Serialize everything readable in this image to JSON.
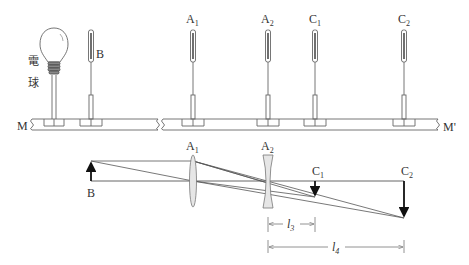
{
  "apparatus": {
    "bulb_label": [
      "電",
      "球"
    ],
    "holders": [
      {
        "id": "B",
        "label": "B",
        "sub": "",
        "x": 91
      },
      {
        "id": "A1",
        "label": "A",
        "sub": "1",
        "x": 193
      },
      {
        "id": "A2",
        "label": "A",
        "sub": "2",
        "x": 268
      },
      {
        "id": "C1",
        "label": "C",
        "sub": "1",
        "x": 315
      },
      {
        "id": "C2",
        "label": "C",
        "sub": "2",
        "x": 404
      }
    ],
    "rail_left_label": "M",
    "rail_right_label": "M'"
  },
  "ray_diagram": {
    "object_label": "B",
    "lens1": {
      "label": "A",
      "sub": "1",
      "type": "convex"
    },
    "lens2": {
      "label": "A",
      "sub": "2",
      "type": "concave"
    },
    "image1": {
      "label": "C",
      "sub": "1"
    },
    "image2": {
      "label": "C",
      "sub": "2"
    },
    "dim1": {
      "label": "l",
      "sub": "3"
    },
    "dim2": {
      "label": "l",
      "sub": "4"
    }
  },
  "colors": {
    "line": "#555555",
    "dark": "#111111",
    "lens_fill": "#e6e6e6"
  }
}
